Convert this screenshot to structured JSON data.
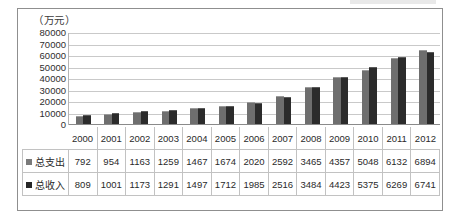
{
  "chart_data": {
    "type": "bar",
    "title": "",
    "subtitle": "",
    "xlabel": "",
    "ylabel": "（万元）",
    "unit_caption": "（万元）",
    "categories": [
      "2000",
      "2001",
      "2002",
      "2003",
      "2004",
      "2005",
      "2006",
      "2007",
      "2008",
      "2009",
      "2010",
      "2011",
      "2012"
    ],
    "ylim": [
      0,
      80000
    ],
    "yticks": [
      80000,
      70000,
      60000,
      50000,
      40000,
      30000,
      20000,
      10000,
      0
    ],
    "ytick_labels": [
      "80000",
      "70000",
      "60000",
      "50000",
      "40000",
      "30000",
      "20000",
      "10000",
      "0"
    ],
    "grid": true,
    "legend_position": "table-row-labels",
    "series": [
      {
        "name": "总支出",
        "color": "#6e6e6e",
        "values": [
          792,
          954,
          1163,
          1259,
          1467,
          1674,
          2020,
          2592,
          3465,
          4357,
          5048,
          6132,
          6894
        ]
      },
      {
        "name": "总收入",
        "color": "#2b2b2b",
        "values": [
          809,
          1001,
          1173,
          1291,
          1497,
          1712,
          1985,
          2516,
          3484,
          4423,
          5375,
          6269,
          6741
        ]
      }
    ],
    "plot_scale_factor": 9.3
  },
  "table": {
    "corner_label": "",
    "year_headers": [
      "2000",
      "2001",
      "2002",
      "2003",
      "2004",
      "2005",
      "2006",
      "2007",
      "2008",
      "2009",
      "2010",
      "2011",
      "2012"
    ],
    "rows": [
      {
        "label": "总支出",
        "marker": "square-marker-icon",
        "color": "#7a7a7a",
        "values": [
          "792",
          "954",
          "1163",
          "1259",
          "1467",
          "1674",
          "2020",
          "2592",
          "3465",
          "4357",
          "5048",
          "6132",
          "6894"
        ]
      },
      {
        "label": "总收入",
        "marker": "square-marker-icon",
        "color": "#262626",
        "values": [
          "809",
          "1001",
          "1173",
          "1291",
          "1497",
          "1712",
          "1985",
          "2516",
          "3484",
          "4423",
          "5375",
          "6269",
          "6741"
        ]
      }
    ]
  }
}
